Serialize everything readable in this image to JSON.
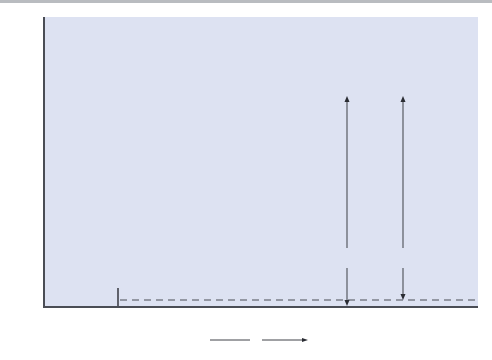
{
  "figure": {
    "y_axis_label": "V(r)",
    "origin_label": "0",
    "x_axis_label": "x",
    "equilibrium_label": "x",
    "equilibrium_subscript": "e",
    "dissociation_energy_label": "D",
    "dissociation_energy_subscript": "e",
    "bond_energy_label": "D",
    "bond_energy_subscript": "0",
    "colors": {
      "plot_background": "#dde2f2",
      "morse_curve": "#e0562a",
      "harmonic_curve": "#e3b23a",
      "levels": "#5a5f6e",
      "axis": "#4a4d55"
    },
    "vibrational_level_count": 22
  }
}
